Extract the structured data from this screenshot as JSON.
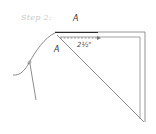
{
  "step": {
    "label": "Step 2:"
  },
  "labels": {
    "top_point": "A",
    "fold_point": "A",
    "measurement": "2½\""
  },
  "colors": {
    "line": "#6e6e6e",
    "dark_line": "#2a2a2a",
    "step_text": "#c8c8c8"
  }
}
